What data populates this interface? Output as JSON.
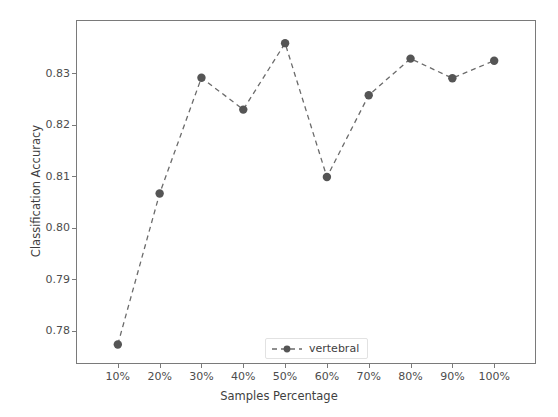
{
  "chart_data": {
    "type": "line",
    "title": "",
    "xlabel": "Samples Percentage",
    "ylabel": "Classification Accuracy",
    "categories": [
      "10%",
      "20%",
      "30%",
      "40%",
      "50%",
      "60%",
      "70%",
      "80%",
      "90%",
      "100%"
    ],
    "series": [
      {
        "name": "vertebral",
        "values": [
          0.7773,
          0.8066,
          0.8291,
          0.8229,
          0.8358,
          0.8098,
          0.8257,
          0.8328,
          0.829,
          0.8324
        ],
        "color": "#555555",
        "linestyle": "dashed",
        "marker": "circle"
      }
    ],
    "xlim": [
      0,
      11
    ],
    "ylim": [
      0.7735,
      0.8403
    ],
    "yticks": [
      "0.78",
      "0.79",
      "0.80",
      "0.81",
      "0.82",
      "0.83"
    ],
    "ytick_values": [
      0.78,
      0.79,
      0.8,
      0.81,
      0.82,
      0.83
    ],
    "grid": false,
    "legend": {
      "position": "lower center",
      "entries": [
        "vertebral"
      ]
    }
  },
  "axes": {
    "frame_color": "#7a7a7a",
    "tick_color": "#4d4d4d",
    "background": "#ffffff"
  }
}
